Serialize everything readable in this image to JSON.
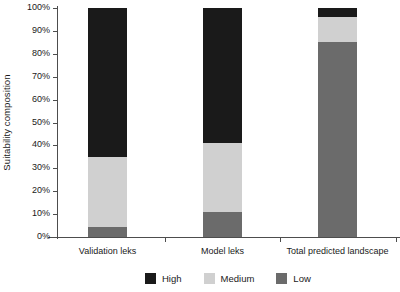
{
  "chart_data": {
    "type": "bar",
    "subtype": "stacked-100-percent",
    "title": "",
    "xlabel": "",
    "ylabel": "Suitability composition",
    "ylim": [
      0,
      100
    ],
    "yunit": "%",
    "grid": false,
    "legend_position": "bottom",
    "categories": [
      "Validation leks",
      "Model leks",
      "Total predicted landscape"
    ],
    "ytick_labels": [
      "0%",
      "10%",
      "20%",
      "30%",
      "40%",
      "50%",
      "60%",
      "70%",
      "80%",
      "90%",
      "100%"
    ],
    "ytick_values": [
      0,
      10,
      20,
      30,
      40,
      50,
      60,
      70,
      80,
      90,
      100
    ],
    "series": [
      {
        "name": "High",
        "color": "#1a1a1a",
        "values": [
          65.0,
          59.0,
          4.0
        ]
      },
      {
        "name": "Medium",
        "color": "#d0d0d0",
        "values": [
          30.5,
          30.0,
          11.0
        ]
      },
      {
        "name": "Low",
        "color": "#6b6b6b",
        "values": [
          4.5,
          11.0,
          85.0
        ]
      }
    ],
    "stack_order_bottom_to_top": [
      "Low",
      "Medium",
      "High"
    ],
    "legend": [
      {
        "label": "High",
        "color": "#1a1a1a"
      },
      {
        "label": "Medium",
        "color": "#d0d0d0"
      },
      {
        "label": "Low",
        "color": "#6b6b6b"
      }
    ]
  },
  "axis": {
    "color": "#4d4d4d"
  }
}
